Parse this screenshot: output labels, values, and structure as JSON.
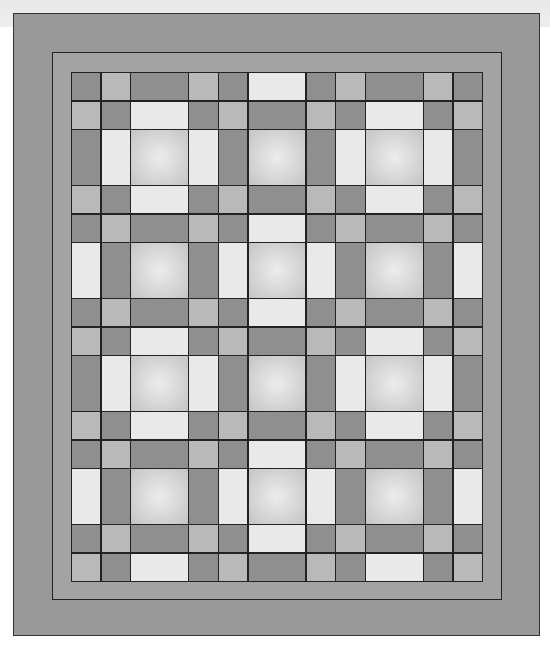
{
  "image": {
    "description": "Quilt pattern diagram with two gray borders and a grid of square and rectangular patches",
    "colors": {
      "background_band": "#ebebeb",
      "outer_border": "#999999",
      "middle_border": "#a3a3a3",
      "dark": "#8f8f8f",
      "medium": "#b9b9b9",
      "light": "#e9e9e9",
      "center_block": "radial #ececec → #c4c4c4",
      "seam_lines": "#222222"
    },
    "grid": {
      "column_sizes": [
        "s",
        "s",
        "B",
        "s",
        "s",
        "B",
        "s",
        "s",
        "B",
        "s",
        "s"
      ],
      "row_sizes": [
        "s",
        "s",
        "B",
        "s",
        "s",
        "B",
        "s",
        "s",
        "B",
        "s",
        "s",
        "B",
        "s",
        "s"
      ],
      "rows": [
        [
          "D",
          "M",
          "D",
          "M",
          "D",
          "L",
          "D",
          "M",
          "D",
          "M",
          "D"
        ],
        [
          "M",
          "D",
          "L",
          "D",
          "M",
          "D",
          "M",
          "D",
          "L",
          "D",
          "M"
        ],
        [
          "D",
          "L",
          "C",
          "L",
          "D",
          "C",
          "D",
          "L",
          "C",
          "L",
          "D"
        ],
        [
          "M",
          "D",
          "L",
          "D",
          "M",
          "D",
          "M",
          "D",
          "L",
          "D",
          "M"
        ],
        [
          "D",
          "M",
          "D",
          "M",
          "D",
          "L",
          "D",
          "M",
          "D",
          "M",
          "D"
        ],
        [
          "L",
          "D",
          "C",
          "D",
          "L",
          "C",
          "L",
          "D",
          "C",
          "D",
          "L"
        ],
        [
          "D",
          "M",
          "D",
          "M",
          "D",
          "L",
          "D",
          "M",
          "D",
          "M",
          "D"
        ],
        [
          "M",
          "D",
          "L",
          "D",
          "M",
          "D",
          "M",
          "D",
          "L",
          "D",
          "M"
        ],
        [
          "D",
          "L",
          "C",
          "L",
          "D",
          "C",
          "D",
          "L",
          "C",
          "L",
          "D"
        ],
        [
          "M",
          "D",
          "L",
          "D",
          "M",
          "D",
          "M",
          "D",
          "L",
          "D",
          "M"
        ],
        [
          "D",
          "M",
          "D",
          "M",
          "D",
          "L",
          "D",
          "M",
          "D",
          "M",
          "D"
        ],
        [
          "L",
          "D",
          "C",
          "D",
          "L",
          "C",
          "L",
          "D",
          "C",
          "D",
          "L"
        ],
        [
          "D",
          "M",
          "D",
          "M",
          "D",
          "L",
          "D",
          "M",
          "D",
          "M",
          "D"
        ],
        [
          "M",
          "D",
          "L",
          "D",
          "M",
          "D",
          "M",
          "D",
          "L",
          "D",
          "M"
        ]
      ]
    }
  }
}
